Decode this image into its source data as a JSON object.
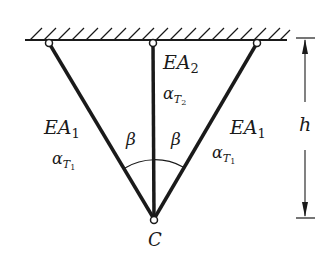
{
  "diagram": {
    "type": "three-bar truss hanging from ceiling",
    "colors": {
      "stroke": "#1a1a1a",
      "background": "#ffffff"
    },
    "support": {
      "label": "fixed ceiling (hatched)"
    },
    "node": {
      "label": "C"
    },
    "bars": [
      {
        "id": "left",
        "stiffness": "EA",
        "stiffness_sub": "1",
        "alpha": "α",
        "alpha_sub": "T",
        "alpha_subsub": "1"
      },
      {
        "id": "middle",
        "stiffness": "EA",
        "stiffness_sub": "2",
        "alpha": "α",
        "alpha_sub": "T",
        "alpha_subsub": "2"
      },
      {
        "id": "right",
        "stiffness": "EA",
        "stiffness_sub": "1",
        "alpha": "α",
        "alpha_sub": "T",
        "alpha_subsub": "1"
      }
    ],
    "angles": [
      {
        "id": "left",
        "label": "β"
      },
      {
        "id": "right",
        "label": "β"
      }
    ],
    "dimension": {
      "label": "h"
    }
  }
}
